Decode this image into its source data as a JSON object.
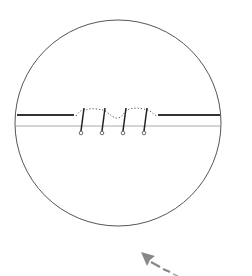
{
  "diagram": {
    "colors": {
      "background": "#ffffff",
      "circle": "#555555",
      "thick_line": "#333333",
      "thin_line": "#aaaaaa",
      "needle": "#222222",
      "dotted_thread": "#555555",
      "arrow": "#888888"
    },
    "magnifier_circle": {
      "cx": 118,
      "cy": 123,
      "r": 103
    },
    "upper_edge": {
      "left": {
        "x1": 17,
        "x2": 74,
        "y": 115
      },
      "right": {
        "x1": 158,
        "x2": 220,
        "y": 115
      }
    },
    "lower_edge": {
      "x1": 16,
      "x2": 220,
      "y": 126
    },
    "needles": [
      {
        "x_top": 84,
        "y_top": 108,
        "x_bottom": 81,
        "y_bottom": 131
      },
      {
        "x_top": 105,
        "y_top": 108,
        "x_bottom": 102,
        "y_bottom": 131
      },
      {
        "x_top": 126,
        "y_top": 108,
        "x_bottom": 123,
        "y_bottom": 131
      },
      {
        "x_top": 147,
        "y_top": 108,
        "x_bottom": 144,
        "y_bottom": 131
      }
    ],
    "arrow": {
      "tip_x": 141,
      "tip_y": 252,
      "tail_x": 178,
      "tail_y": 274,
      "style": "dashed",
      "direction": "up-left"
    }
  }
}
